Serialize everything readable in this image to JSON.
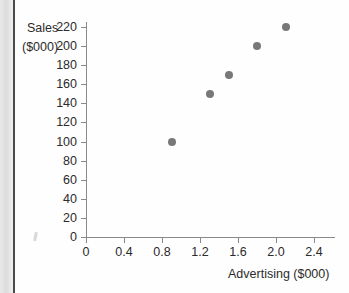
{
  "figure": {
    "background_color": "#fefefe",
    "marker_color": "#787878",
    "axis_color": "#8a8a8a",
    "text_color": "#2b2b2b"
  },
  "scan": {
    "gutter_name": "page-gutter",
    "binding_name": "binding-line",
    "speck_name": "scan-artifact"
  },
  "axis_titles": {
    "y_line1": "Sales",
    "y_line2": "($000)",
    "x": "Advertising ($000)"
  },
  "chart_data": {
    "type": "scatter",
    "title": "",
    "xlabel": "Advertising ($000)",
    "ylabel": "Sales ($000)",
    "xlim": [
      0,
      2.6
    ],
    "ylim": [
      0,
      230
    ],
    "grid": false,
    "legend": "none",
    "x_ticks": [
      0,
      0.4,
      0.8,
      1.2,
      1.6,
      2.0,
      2.4
    ],
    "x_tick_labels": [
      "0",
      "0.4",
      "0.8",
      "1.2",
      "1.6",
      "2.0",
      "2.4"
    ],
    "y_ticks": [
      0,
      20,
      40,
      60,
      80,
      100,
      120,
      140,
      160,
      180,
      200,
      220
    ],
    "y_tick_labels": [
      "0",
      "20",
      "40",
      "60",
      "80",
      "100",
      "120",
      "140",
      "160",
      "180",
      "200",
      "220"
    ],
    "series": [
      {
        "name": "Sales vs Advertising",
        "marker": "circle",
        "color": "#787878",
        "points": [
          {
            "x": 0.9,
            "y": 100
          },
          {
            "x": 1.3,
            "y": 150
          },
          {
            "x": 1.5,
            "y": 170
          },
          {
            "x": 1.8,
            "y": 200
          },
          {
            "x": 2.1,
            "y": 220
          }
        ]
      }
    ]
  }
}
